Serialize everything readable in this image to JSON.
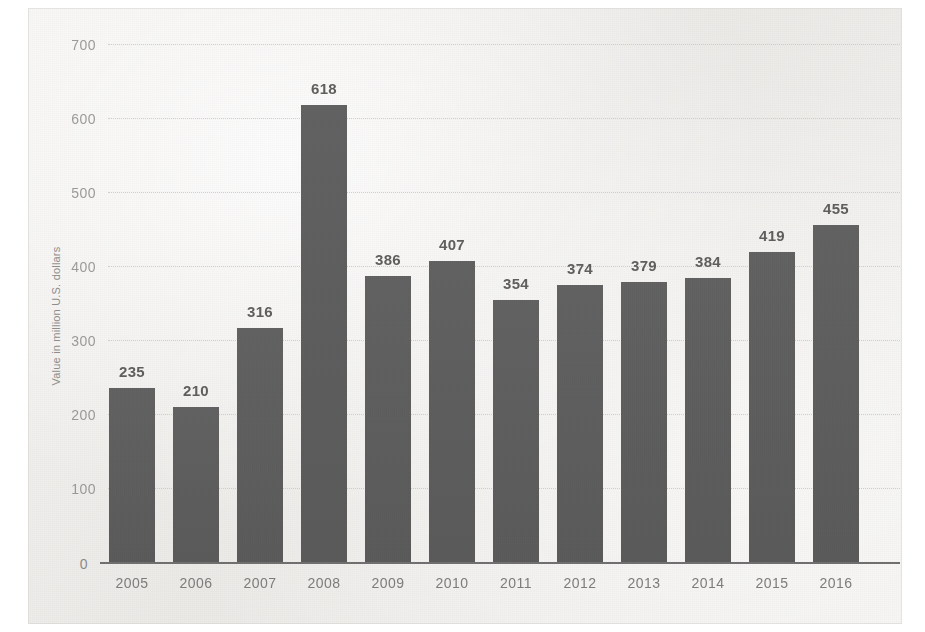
{
  "chart_data": {
    "type": "bar",
    "title": "",
    "xlabel": "",
    "ylabel": "Value in million U.S. dollars",
    "categories": [
      "2005",
      "2006",
      "2007",
      "2008",
      "2009",
      "2010",
      "2011",
      "2012",
      "2013",
      "2014",
      "2015",
      "2016"
    ],
    "values": [
      235,
      210,
      316,
      618,
      386,
      407,
      354,
      374,
      379,
      384,
      419,
      455
    ],
    "ylim": [
      0,
      700
    ],
    "yticks": [
      0,
      100,
      200,
      300,
      400,
      500,
      600,
      700
    ],
    "ytick_labels": [
      "0",
      "100",
      "200",
      "300",
      "400",
      "500",
      "600",
      "700"
    ],
    "data_labels": [
      "235",
      "210",
      "316",
      "618",
      "386",
      "407",
      "354",
      "374",
      "379",
      "384",
      "419",
      "455"
    ],
    "grid": true,
    "legend": false,
    "legend_position": "none",
    "bar_color": "#5c5c5c",
    "background_color": "#f2f1ef",
    "axis_text_color": "#8b8a88",
    "label_text_color": "#5f5e5c"
  }
}
